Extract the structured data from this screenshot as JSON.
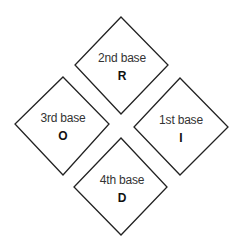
{
  "diagram": {
    "type": "four diamonds arranged in a baseball-diamond pattern",
    "stroke_color": "#222222",
    "fill_color": "#ffffff",
    "bases": [
      {
        "id": "second",
        "name": "2nd base",
        "letter": "R",
        "position": "top"
      },
      {
        "id": "third",
        "name": "3rd base",
        "letter": "O",
        "position": "left"
      },
      {
        "id": "first",
        "name": "1st base",
        "letter": "I",
        "position": "right"
      },
      {
        "id": "fourth",
        "name": "4th base",
        "letter": "D",
        "position": "bottom"
      }
    ]
  }
}
